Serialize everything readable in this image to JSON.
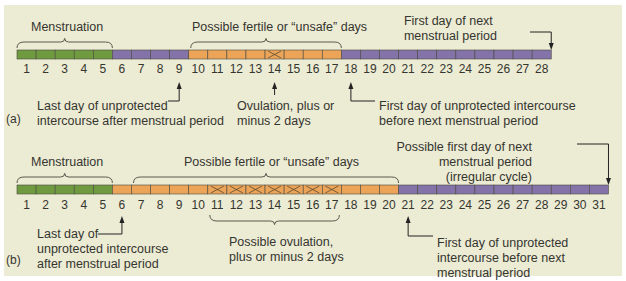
{
  "colors": {
    "menstruation": "#6f9a3f",
    "infertile": "#8473a8",
    "fertile": "#eba458",
    "border": "#4a4a40",
    "background": "#ecebd4"
  },
  "panel_a": {
    "label": "(a)",
    "cycle_length": 28,
    "segments": [
      {
        "type": "menstruation",
        "from": 1,
        "to": 5
      },
      {
        "type": "infertile",
        "from": 6,
        "to": 9
      },
      {
        "type": "fertile",
        "from": 10,
        "to": 17
      },
      {
        "type": "infertile",
        "from": 18,
        "to": 28
      }
    ],
    "ovulation_days": [
      14
    ],
    "menstruation_label": "Menstruation",
    "fertile_label": "Possible fertile or “unsafe” days",
    "next_period_label": [
      "First day of next",
      "menstrual period"
    ],
    "last_day_label": [
      "Last day of unprotected",
      "intercourse after menstrual period"
    ],
    "ovulation_label": [
      "Ovulation, plus or",
      "minus 2 days"
    ],
    "first_day_label": [
      "First day of unprotected intercourse",
      "before next menstrual period"
    ]
  },
  "panel_b": {
    "label": "(b)",
    "cycle_length": 31,
    "segments": [
      {
        "type": "menstruation",
        "from": 1,
        "to": 5
      },
      {
        "type": "fertile",
        "from": 6,
        "to": 20
      },
      {
        "type": "infertile",
        "from": 21,
        "to": 31
      }
    ],
    "ovulation_days": [
      11,
      12,
      13,
      14,
      15,
      16,
      17
    ],
    "menstruation_label": "Menstruation",
    "fertile_label": "Possible fertile or “unsafe” days",
    "next_period_label": [
      "Possible first day of next",
      "menstrual period",
      "(irregular cycle)"
    ],
    "last_day_label": [
      "Last day of",
      "unprotected intercourse",
      "after menstrual period"
    ],
    "ovulation_label": [
      "Possible ovulation,",
      "plus or minus 2 days"
    ],
    "first_day_label": [
      "First day of unprotected",
      "intercourse before next",
      "menstrual period"
    ]
  }
}
